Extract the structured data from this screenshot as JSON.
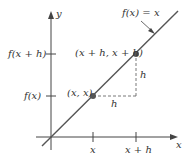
{
  "diagram": {
    "axes": {
      "x_label": "x",
      "y_label": "y"
    },
    "function_label": "f(x) = x",
    "points": [
      {
        "label": "(x, x)"
      },
      {
        "label": "(x + h, x + h)"
      }
    ],
    "y_ticks": [
      {
        "label": "f(x + h)"
      },
      {
        "label": "f(x)"
      }
    ],
    "x_ticks": [
      {
        "label": "x"
      },
      {
        "label": "x + h"
      }
    ],
    "increments": {
      "horizontal": "h",
      "vertical": "h"
    },
    "colors": {
      "axis": "#444444",
      "line": "#555555",
      "point": "#555555",
      "dashed": "#555555",
      "text": "#333333"
    }
  }
}
